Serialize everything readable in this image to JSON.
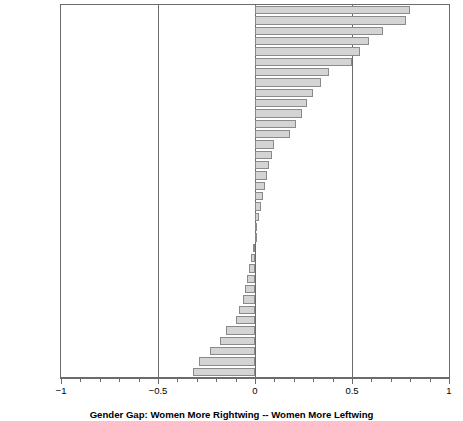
{
  "chart_data": {
    "type": "bar",
    "orientation": "horizontal",
    "title": "",
    "xlabel": "Gender Gap: Women More Rightwing -- Women More Leftwing",
    "ylabel": "",
    "xlim": [
      -1,
      1
    ],
    "xticks": [
      -1,
      -0.5,
      0,
      0.5,
      1
    ],
    "xticklabels": [
      "−1",
      "−0.5",
      "0",
      "0.5",
      "1"
    ],
    "minor_tick_step": 0.1,
    "grid": false,
    "legend": null,
    "reference_lines": [
      -0.5,
      0,
      0.5
    ],
    "bar_fill_color": "#d4d4d4",
    "bar_edge_color": "#8a8a8a",
    "categories": [
      "Japan",
      "Ireland",
      "Denmark",
      "Austria",
      "Netherlands",
      "E.Germany",
      "USA",
      "Norway",
      "Sweden",
      "Switzerland",
      "Canada",
      "Argentina",
      "Ukraine",
      "W.Germany",
      "Italy",
      "Lithuania",
      "N.Ireland",
      "S.Africa",
      "Portugal",
      "Iceland",
      "Brazil",
      "Romania",
      "Britain",
      "Australia",
      "France",
      "Taiwan",
      "Hungary",
      "Belgium",
      "Poland",
      "Estonia",
      "India",
      "Mexico",
      "Finland",
      "Spain",
      "Chile",
      "Turkey"
    ],
    "values": [
      0.8,
      0.78,
      0.66,
      0.59,
      0.54,
      0.5,
      0.38,
      0.34,
      0.3,
      0.27,
      0.24,
      0.21,
      0.18,
      0.1,
      0.09,
      0.07,
      0.06,
      0.05,
      0.04,
      0.03,
      0.02,
      0.01,
      0.0,
      -0.01,
      -0.02,
      -0.03,
      -0.04,
      -0.05,
      -0.06,
      -0.08,
      -0.1,
      -0.15,
      -0.18,
      -0.23,
      -0.29,
      -0.32
    ]
  }
}
